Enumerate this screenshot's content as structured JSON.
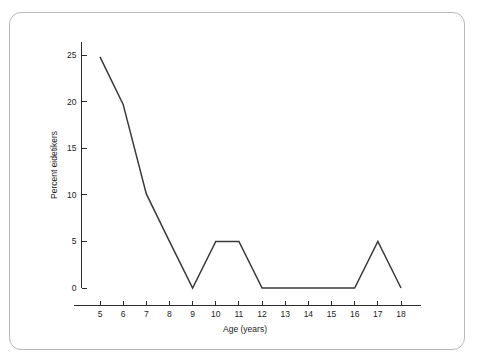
{
  "figure": {
    "frame_color": "#b9b9b9",
    "background_color": "#ffffff",
    "line_color": "#3a3a3a",
    "text_color": "#1c1c1c"
  },
  "chart_data": {
    "type": "line",
    "title": "",
    "subtitle": "",
    "xlabel": "Age (years)",
    "ylabel": "Percent eidetikers",
    "x": [
      5,
      6,
      7,
      8,
      9,
      10,
      11,
      12,
      13,
      14,
      15,
      16,
      17,
      18
    ],
    "values": [
      24.8,
      19.7,
      10.1,
      5.0,
      0.0,
      5.0,
      5.0,
      0.0,
      0.0,
      0.0,
      0.0,
      0.0,
      5.0,
      0.0
    ],
    "series": [
      {
        "name": "Percent eidetikers",
        "values": [
          24.8,
          19.7,
          10.1,
          5.0,
          0.0,
          5.0,
          5.0,
          0.0,
          0.0,
          0.0,
          0.0,
          0.0,
          5.0,
          0.0
        ]
      }
    ],
    "xlim": [
      4.3,
      18.7
    ],
    "ylim": [
      0,
      27
    ],
    "xticks": [
      5,
      6,
      7,
      8,
      9,
      10,
      11,
      12,
      13,
      14,
      15,
      16,
      17,
      18
    ],
    "xtick_labels": [
      "5",
      "6",
      "7",
      "8",
      "9",
      "10",
      "11",
      "12",
      "13",
      "14",
      "15",
      "16",
      "17",
      "18"
    ],
    "yticks": [
      0,
      5,
      10,
      15,
      20,
      25
    ],
    "ytick_labels": [
      "0",
      "5",
      "10",
      "15",
      "20",
      "25"
    ],
    "grid": false,
    "legend": false,
    "legend_position": "none",
    "annotations": []
  }
}
